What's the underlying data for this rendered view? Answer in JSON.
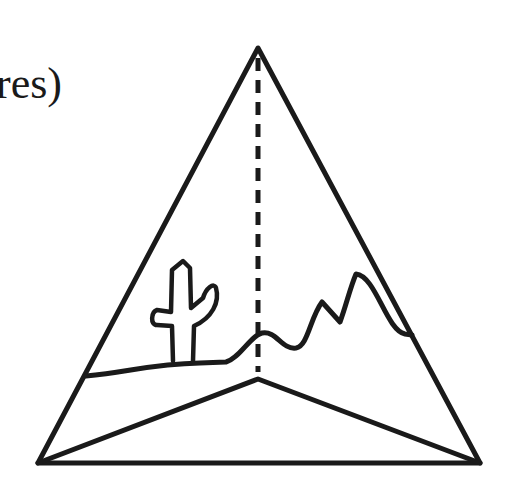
{
  "diagram": {
    "caption_fragment": "res)",
    "colors": {
      "stroke": "#1a1a1a",
      "background": "#ffffff"
    },
    "shape": "triangular-pyramid",
    "scene": [
      "cactus",
      "desert-horizon",
      "mountains"
    ],
    "dashed_line": "height from apex to base point"
  }
}
